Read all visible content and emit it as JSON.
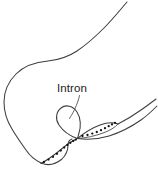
{
  "figure": {
    "kind": "diagram",
    "background_color": "#ffffff",
    "stroke_color": "#3d3d42",
    "bead_color": "#141417",
    "width": 158,
    "height": 177,
    "labels": [
      {
        "id": "intron",
        "text": "Intron",
        "x": 72,
        "y": 92,
        "anchor": "middle",
        "font_size": 11.5,
        "color": "#1b1b1e"
      }
    ],
    "leader_lines": [
      {
        "id": "intron-leader",
        "from_x": 79,
        "from_y": 95,
        "to_x": 69,
        "to_y": 119,
        "path": "M79.5,95.5 C78.5,101 75,110 69.5,118.5"
      }
    ],
    "strands": [
      {
        "id": "upper-long-tail",
        "role": "single-stranded-dna-upper-arm",
        "path": "M127,2 C121,9 113,19 104,28 C95,37 86,45 77,51 C68,57 58,60 48,61 C36,62 24,66 16,74 C8,82 4,92 4,102 C4,112 7,121 12,129 C16,136 21,143 26,150 C30,156 35,160 41,163"
      },
      {
        "id": "lower-left-arc",
        "role": "duplex-lower-left",
        "path": "M41,163 C48,166 56,164 62,159 C66,155 68,150 68,145 C68,142 69,140 72,139"
      },
      {
        "id": "beaded-left-edge",
        "role": "rna-dna-hybrid-left",
        "path": "M41,163.5 C49,159 57,153 64,147 C68,143.5 73,140.5 77.5,138.5"
      },
      {
        "id": "intron-loop",
        "role": "displaced-intron-loop",
        "path": "M77.5,138.5 C70,136 63,131 59,125 C55,119 56,112 61,108 C66,104 73,106 77,112 C81,118 81,127 79,133 C78.3,135.3 78,137.2 77.5,138.5 Z"
      },
      {
        "id": "lens-upper-edge",
        "role": "duplex-upper-right",
        "path": "M77.5,138.5 C84,133 92,128 100,125 C107,122.5 113,122 118,124"
      },
      {
        "id": "lens-lower-edge",
        "role": "rna-dna-hybrid-right",
        "path": "M77.5,138.5 C86,138 95,136 103,133 C110,130.5 115,127.5 118,124"
      },
      {
        "id": "right-tail",
        "role": "single-stranded-dna-right-arm",
        "path": "M118,124 C126,120 134,115 141,110 C147,106 152,102 156,99"
      },
      {
        "id": "right-tail-lower",
        "role": "single-stranded-dna-right-arm-lower",
        "path": "M77.5,138.5 C88,140 99,139 109,136 C120,132.5 131,127 141,120 C148,115 153,110 157,106"
      }
    ],
    "beads": {
      "left_segment": {
        "count": 10,
        "radius": 1.15,
        "points": [
          [
            44.0,
            162.0
          ],
          [
            48.5,
            159.6
          ],
          [
            53.0,
            156.8
          ],
          [
            57.0,
            153.8
          ],
          [
            60.8,
            150.6
          ],
          [
            64.2,
            147.6
          ],
          [
            67.4,
            145.0
          ],
          [
            70.4,
            142.8
          ],
          [
            73.2,
            141.0
          ],
          [
            75.8,
            139.6
          ]
        ]
      },
      "right_segment": {
        "count": 9,
        "radius": 1.15,
        "points": [
          [
            82.5,
            136.0
          ],
          [
            87.5,
            135.0
          ],
          [
            92.3,
            133.6
          ],
          [
            96.8,
            132.0
          ],
          [
            101.0,
            130.2
          ],
          [
            105.0,
            128.2
          ],
          [
            108.7,
            126.2
          ],
          [
            112.0,
            124.4
          ],
          [
            115.0,
            122.8
          ]
        ]
      }
    }
  }
}
